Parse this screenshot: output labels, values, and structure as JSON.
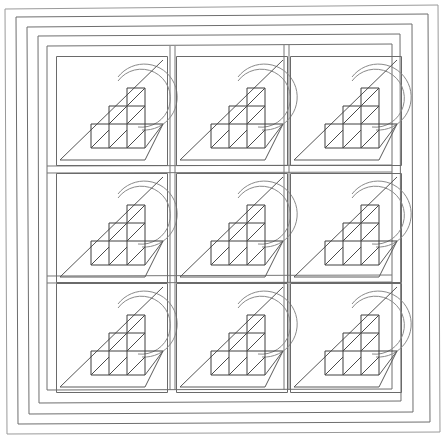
{
  "drawing": {
    "title": "Decorative Window Grille",
    "subject": "architectural-line-drawing",
    "width": 445,
    "height": 438,
    "background_color": "#ffffff",
    "line_color": "#555555",
    "style": "monochrome line art, thin strokes, no fill"
  },
  "frame": {
    "name": "window-frame",
    "description": "Nested rectangular frames forming the window casing, drawn with slight perspective skew",
    "rings": [
      {
        "id": "outer",
        "label": "outer-casing",
        "x": 5,
        "y": 5,
        "w": 435,
        "h": 428,
        "color": "#9a9a9a"
      },
      {
        "id": "ring2",
        "label": "outer-reveal",
        "x": 16,
        "y": 14,
        "w": 413,
        "h": 410,
        "color": "#808080"
      },
      {
        "id": "ring3",
        "label": "sash-outer",
        "x": 27,
        "y": 24,
        "w": 385,
        "h": 390,
        "color": "#777777"
      },
      {
        "id": "ring4",
        "label": "sash-inner",
        "x": 38,
        "y": 34,
        "w": 362,
        "h": 369,
        "color": "#6e6e6e"
      },
      {
        "id": "ring5",
        "label": "glazing-bead",
        "x": 47,
        "y": 44,
        "w": 345,
        "h": 345,
        "color": "#6a6a6a"
      }
    ]
  },
  "grid": {
    "name": "pane-grid",
    "rows": 3,
    "columns": 3,
    "cell_count": 9,
    "origin_x": 55,
    "origin_y": 56,
    "cell_width": 112,
    "cell_height": 110,
    "gap_x": 8,
    "gap_y": 7,
    "mullion_color": "#777777"
  },
  "motif": {
    "name": "pane-motif",
    "description": "Repeated decorative motif: a double concentric arc, a full-pane diagonal, and a stepped staircase of small squares each crossed by a diagonal",
    "parts": [
      {
        "id": "arc",
        "label": "double-arc",
        "shape": "two concentric circular arcs, open at lower-right",
        "count": 2
      },
      {
        "id": "diag",
        "label": "main-diagonal",
        "shape": "line from bottom-left to top-right of pane"
      },
      {
        "id": "steps",
        "label": "staircase-grid",
        "shape": "3-step stair of unit squares",
        "step_counts": [
          3,
          2,
          1
        ]
      },
      {
        "id": "hatch",
        "label": "square-diagonals",
        "shape": "one diagonal inside each unit square"
      },
      {
        "id": "shelf",
        "label": "lower-shelf",
        "shape": "horizontal ledge line with return diagonal"
      }
    ],
    "repetitions": 9,
    "arc_radius_outer": 33,
    "arc_radius_inner": 29,
    "unit_square": 18
  },
  "cells": [
    {
      "id": "cell-r1c1",
      "row": 1,
      "column": 1,
      "label": "Pane 1"
    },
    {
      "id": "cell-r1c2",
      "row": 1,
      "column": 2,
      "label": "Pane 2"
    },
    {
      "id": "cell-r1c3",
      "row": 1,
      "column": 3,
      "label": "Pane 3"
    },
    {
      "id": "cell-r2c1",
      "row": 2,
      "column": 1,
      "label": "Pane 4"
    },
    {
      "id": "cell-r2c2",
      "row": 2,
      "column": 2,
      "label": "Pane 5"
    },
    {
      "id": "cell-r2c3",
      "row": 2,
      "column": 3,
      "label": "Pane 6"
    },
    {
      "id": "cell-r3c1",
      "row": 3,
      "column": 1,
      "label": "Pane 7"
    },
    {
      "id": "cell-r3c2",
      "row": 3,
      "column": 2,
      "label": "Pane 8"
    },
    {
      "id": "cell-r3c3",
      "row": 3,
      "column": 3,
      "label": "Pane 9"
    }
  ]
}
